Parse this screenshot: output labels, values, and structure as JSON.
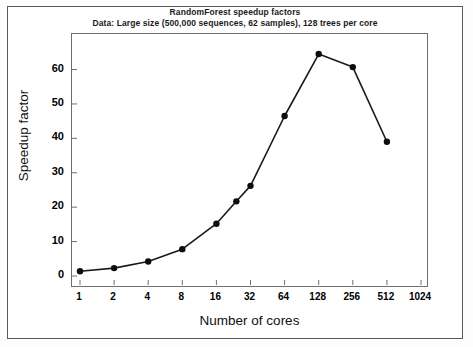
{
  "chart_data": {
    "type": "line",
    "title": "RandomForest speedup factors",
    "subtitle": "Data: Large size (500,000 sequences, 62 samples), 128 trees per core",
    "xlabel": "Number of cores",
    "ylabel": "Speedup factor",
    "x_scale": "log2",
    "x": [
      1,
      2,
      4,
      8,
      16,
      24,
      32,
      64,
      128,
      256,
      512
    ],
    "values": [
      1.4,
      2.3,
      4.2,
      7.8,
      15.2,
      21.7,
      26.2,
      46.5,
      64.5,
      60.7,
      39.0
    ],
    "x_tick_labels": [
      "1",
      "2",
      "4",
      "8",
      "16",
      "32",
      "64",
      "128",
      "256",
      "512",
      "1024"
    ],
    "x_tick_values": [
      1,
      2,
      4,
      8,
      16,
      32,
      64,
      128,
      256,
      512,
      1024
    ],
    "y_tick_labels": [
      "0",
      "10",
      "20",
      "30",
      "40",
      "50",
      "60"
    ],
    "y_tick_values": [
      0,
      10,
      20,
      30,
      40,
      50,
      60
    ],
    "ylim": [
      0,
      68
    ],
    "grid": false,
    "legend": "none",
    "marker": "filled-circle",
    "line_color": "#1a1a1a",
    "marker_color": "#0d0d0d"
  }
}
